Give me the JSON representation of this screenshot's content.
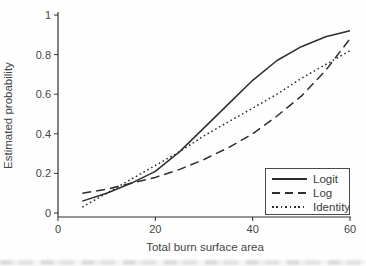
{
  "figure": {
    "background_color": "#fefefe",
    "ink_color": "#2e2e2e",
    "text_color": "#454545"
  },
  "chart_data": {
    "type": "line",
    "title": "",
    "xlabel": "Total burn surface area",
    "ylabel": "Estimated probability",
    "xlim": [
      0,
      60
    ],
    "ylim": [
      0,
      1
    ],
    "xticks": [
      0,
      20,
      40,
      60
    ],
    "xtick_labels": [
      "0",
      "20",
      "40",
      "60"
    ],
    "yticks": [
      0,
      0.2,
      0.4,
      0.6,
      0.8,
      1
    ],
    "ytick_labels": [
      "0",
      "0.2",
      "0.4",
      "0.6",
      "0.8",
      "1"
    ],
    "grid": false,
    "legend_position": "lower-right",
    "x": [
      5,
      10,
      15,
      20,
      25,
      30,
      35,
      40,
      45,
      50,
      55,
      60
    ],
    "series": [
      {
        "name": "Logit",
        "style": "solid",
        "values": [
          0.06,
          0.1,
          0.15,
          0.21,
          0.31,
          0.43,
          0.55,
          0.67,
          0.77,
          0.84,
          0.89,
          0.92
        ]
      },
      {
        "name": "Log",
        "style": "long-dash",
        "values": [
          0.1,
          0.12,
          0.15,
          0.18,
          0.22,
          0.27,
          0.33,
          0.4,
          0.49,
          0.59,
          0.72,
          0.88
        ]
      },
      {
        "name": "Identity",
        "style": "dotted",
        "values": [
          0.03,
          0.1,
          0.17,
          0.24,
          0.31,
          0.39,
          0.46,
          0.53,
          0.6,
          0.68,
          0.75,
          0.82
        ]
      }
    ]
  }
}
